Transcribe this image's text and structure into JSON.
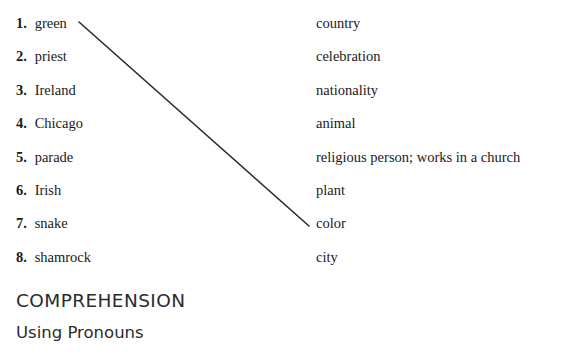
{
  "page": {
    "background_color": "#ffffff",
    "text_color": "#1a1a1a"
  },
  "exercise": {
    "terms": [
      {
        "number": "1.",
        "label": "green"
      },
      {
        "number": "2.",
        "label": "priest"
      },
      {
        "number": "3.",
        "label": "Ireland"
      },
      {
        "number": "4.",
        "label": "Chicago"
      },
      {
        "number": "5.",
        "label": "parade"
      },
      {
        "number": "6.",
        "label": "Irish"
      },
      {
        "number": "7.",
        "label": "snake"
      },
      {
        "number": "8.",
        "label": "shamrock"
      }
    ],
    "definitions": [
      {
        "label": "country"
      },
      {
        "label": "celebration"
      },
      {
        "label": "nationality"
      },
      {
        "label": "animal"
      },
      {
        "label": "religious person; works in a church"
      },
      {
        "label": "plant"
      },
      {
        "label": "color"
      },
      {
        "label": "city"
      }
    ],
    "connections": [
      {
        "from_term": "green",
        "to_definition": "color",
        "x1": 79,
        "y1": 22,
        "x2": 309,
        "y2": 226,
        "color": "#2a2a2a",
        "width": 1.6
      }
    ]
  },
  "section": {
    "title": "COMPREHENSION",
    "subtitle": "Using Pronouns"
  }
}
